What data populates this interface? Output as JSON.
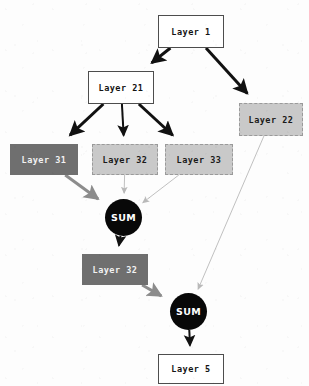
{
  "diagram": {
    "canvas": {
      "width": 309,
      "height": 386,
      "background": "#fdfdfd"
    },
    "palette": {
      "white_node_fill": "#ffffff",
      "white_node_border": "#4d4d4d",
      "dark_node_fill": "#6f6f6f",
      "dark_node_text": "#f2f2f2",
      "light_node_fill": "#c9c9c9",
      "light_node_border": "#9a9a9a",
      "circle_fill": "#080808",
      "circle_text": "#ffffff",
      "edge_black": "#111111",
      "edge_gray": "#8c8c8c",
      "edge_light": "#b9b9b9"
    },
    "nodes": [
      {
        "id": "layer1",
        "label": "Layer 1",
        "shape": "rect",
        "style": "style-white",
        "x": 158,
        "y": 15,
        "w": 66,
        "h": 33
      },
      {
        "id": "layer21",
        "label": "Layer 21",
        "shape": "rect",
        "style": "style-white",
        "x": 88,
        "y": 71,
        "w": 66,
        "h": 33
      },
      {
        "id": "layer22",
        "label": "Layer 22",
        "shape": "rect",
        "style": "style-light-dashed",
        "x": 239,
        "y": 103,
        "w": 64,
        "h": 33
      },
      {
        "id": "layer31",
        "label": "Layer 31",
        "shape": "rect",
        "style": "style-dark",
        "x": 10,
        "y": 144,
        "w": 68,
        "h": 31
      },
      {
        "id": "layer32a",
        "label": "Layer 32",
        "shape": "rect",
        "style": "style-light-dashed",
        "x": 92,
        "y": 144,
        "w": 66,
        "h": 31
      },
      {
        "id": "layer33",
        "label": "Layer 33",
        "shape": "rect",
        "style": "style-light-dashed",
        "x": 165,
        "y": 144,
        "w": 68,
        "h": 31
      },
      {
        "id": "sum1",
        "label": "SUM",
        "shape": "circle",
        "style": "node-circle",
        "x": 105,
        "y": 199,
        "w": 37,
        "h": 37
      },
      {
        "id": "layer32b",
        "label": "Layer 32",
        "shape": "rect",
        "style": "style-dark",
        "x": 82,
        "y": 254,
        "w": 66,
        "h": 31
      },
      {
        "id": "sum2",
        "label": "SUM",
        "shape": "circle",
        "style": "node-circle",
        "x": 170,
        "y": 293,
        "w": 37,
        "h": 37
      },
      {
        "id": "layer5",
        "label": "Layer 5",
        "shape": "rect",
        "style": "style-white",
        "x": 158,
        "y": 354,
        "w": 66,
        "h": 30
      }
    ],
    "edges": [
      {
        "id": "e1",
        "from": "layer1",
        "to": "layer21",
        "weight": "thick",
        "color": "#111111"
      },
      {
        "id": "e2",
        "from": "layer1",
        "to": "layer22",
        "weight": "thick",
        "color": "#111111"
      },
      {
        "id": "e3",
        "from": "layer21",
        "to": "layer31",
        "weight": "thick",
        "color": "#111111"
      },
      {
        "id": "e4",
        "from": "layer21",
        "to": "layer32a",
        "weight": "medium",
        "color": "#111111"
      },
      {
        "id": "e5",
        "from": "layer21",
        "to": "layer33",
        "weight": "thick",
        "color": "#111111"
      },
      {
        "id": "e6",
        "from": "layer31",
        "to": "sum1",
        "weight": "thick",
        "color": "#8c8c8c"
      },
      {
        "id": "e7",
        "from": "layer32a",
        "to": "sum1",
        "weight": "thin",
        "color": "#b9b9b9"
      },
      {
        "id": "e8",
        "from": "layer33",
        "to": "sum1",
        "weight": "thin",
        "color": "#b9b9b9"
      },
      {
        "id": "e9",
        "from": "sum1",
        "to": "layer32b",
        "weight": "medium",
        "color": "#111111"
      },
      {
        "id": "e10",
        "from": "layer32b",
        "to": "sum2",
        "weight": "thick",
        "color": "#8c8c8c"
      },
      {
        "id": "e11",
        "from": "layer22",
        "to": "sum2",
        "weight": "thin",
        "color": "#b9b9b9"
      },
      {
        "id": "e12",
        "from": "sum2",
        "to": "layer5",
        "weight": "medium",
        "color": "#111111"
      }
    ]
  }
}
